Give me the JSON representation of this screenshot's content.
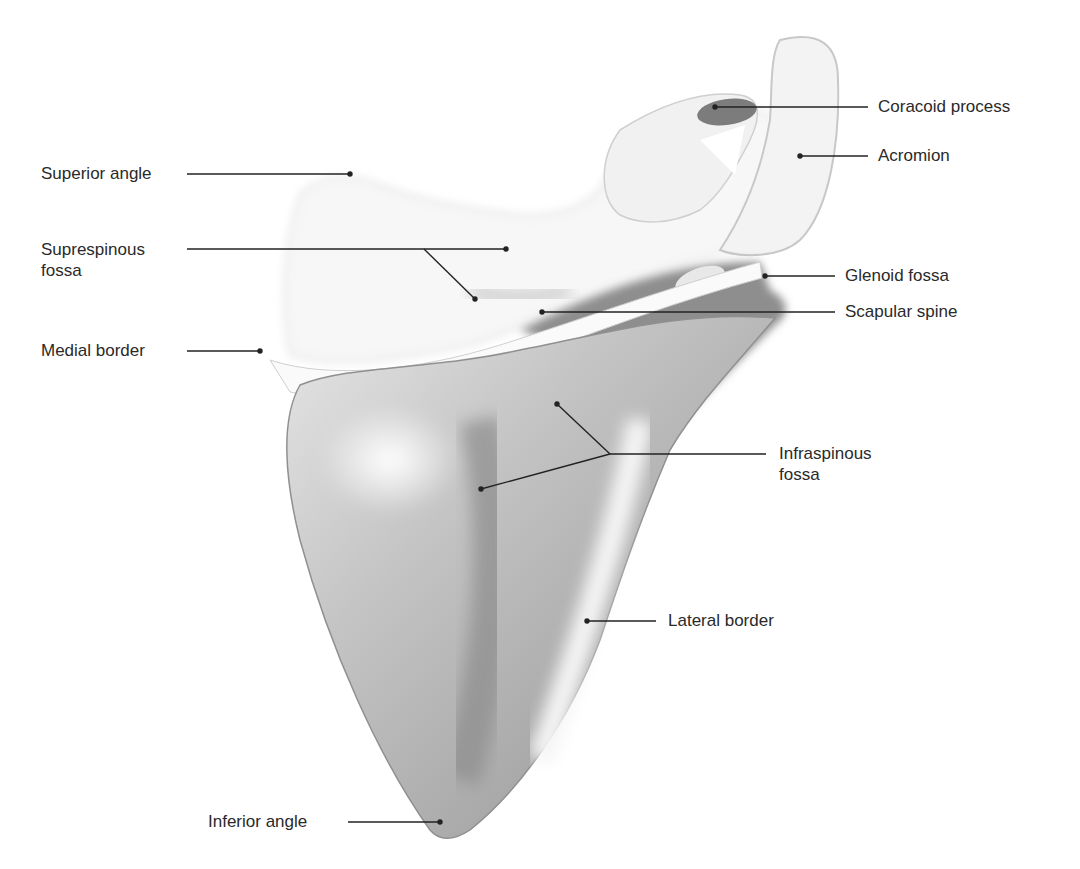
{
  "figure": {
    "colors": {
      "background": "#ffffff",
      "text": "#2a2a2a",
      "leader": "#222222",
      "bone_light": "#f4f4f4",
      "bone_mid": "#b9b9b9",
      "bone_dark": "#7a7a7a"
    }
  },
  "labels": [
    {
      "id": "coracoid-process",
      "text": "Coracoid process",
      "x": 878,
      "y": 95
    },
    {
      "id": "acromion",
      "text": "Acromion",
      "x": 878,
      "y": 145
    },
    {
      "id": "superior-angle",
      "text": "Superior angle",
      "x": 41,
      "y": 163
    },
    {
      "id": "supraspinous-fossa",
      "text": "Suprespinous\nfossa",
      "x": 41,
      "y": 240
    },
    {
      "id": "glenoid-fossa",
      "text": "Glenoid fossa",
      "x": 845,
      "y": 265
    },
    {
      "id": "scapular-spine",
      "text": "Scapular spine",
      "x": 845,
      "y": 300
    },
    {
      "id": "medial-border",
      "text": "Medial border",
      "x": 41,
      "y": 340
    },
    {
      "id": "infraspinous-fossa",
      "text": "Infraspinous\nfossa",
      "x": 779,
      "y": 440
    },
    {
      "id": "lateral-border",
      "text": "Lateral border",
      "x": 668,
      "y": 610
    },
    {
      "id": "inferior-angle",
      "text": "Inferior angle",
      "x": 208,
      "y": 812
    }
  ]
}
